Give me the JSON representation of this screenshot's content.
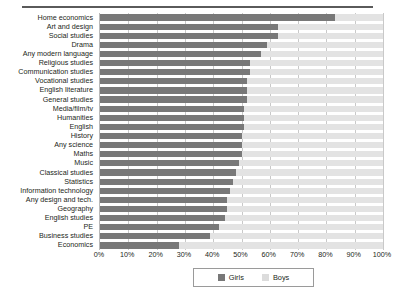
{
  "chart_data": {
    "type": "bar",
    "orientation": "horizontal",
    "stacked": true,
    "title": "",
    "xlabel": "",
    "ylabel": "",
    "xlim": [
      0,
      100
    ],
    "grid": true,
    "legend_position": "bottom",
    "xticks": [
      "0%",
      "10%",
      "20%",
      "30%",
      "40%",
      "50%",
      "60%",
      "70%",
      "80%",
      "90%",
      "100%"
    ],
    "xtick_values": [
      0,
      10,
      20,
      30,
      40,
      50,
      60,
      70,
      80,
      90,
      100
    ],
    "categories": [
      "Home economics",
      "Art and design",
      "Social studies",
      "Drama",
      "Any modern language",
      "Religious studies",
      "Communication studies",
      "Vocational studies",
      "English literature",
      "General studies",
      "Media/film/tv",
      "Humanities",
      "English",
      "History",
      "Any science",
      "Maths",
      "Music",
      "Classical studies",
      "Statistics",
      "Information technology",
      "Any design and tech.",
      "Geography",
      "English studies",
      "PE",
      "Business studies",
      "Economics"
    ],
    "series": [
      {
        "name": "Girls",
        "color": "#787878",
        "values": [
          83,
          63,
          63,
          59,
          57,
          53,
          53,
          52,
          52,
          52,
          51,
          51,
          51,
          50,
          50,
          50,
          49,
          48,
          47,
          46,
          45,
          45,
          44,
          42,
          39,
          28
        ]
      },
      {
        "name": "Boys",
        "color": "#e3e3e3",
        "values": [
          17,
          37,
          37,
          41,
          43,
          47,
          47,
          48,
          48,
          48,
          49,
          49,
          49,
          50,
          50,
          50,
          51,
          52,
          53,
          54,
          55,
          55,
          56,
          58,
          61,
          72
        ]
      }
    ],
    "legend": [
      {
        "label": "Girls",
        "swatch": "girls"
      },
      {
        "label": "Boys",
        "swatch": "boys"
      }
    ]
  }
}
